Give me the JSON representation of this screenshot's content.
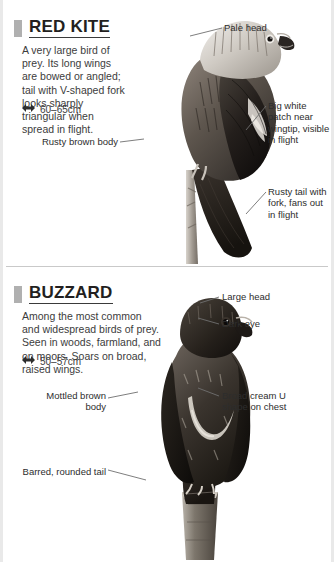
{
  "page": {
    "section_marker_color": "#b0b0b0",
    "text_color": "#2d2d2d",
    "leader_color": "#6f6f6f"
  },
  "entries": [
    {
      "id": "red-kite",
      "name": "RED KITE",
      "description": "A very large bird of prey. Its long wings are bowed or angled; tail with V-shaped fork looks sharply triangular when spread in flight.",
      "size_icon": "double-arrow-icon",
      "size": "60–65cm",
      "photo_alt": "Red kite perched, side view",
      "labels": [
        {
          "id": "pale-head",
          "text": "Pale head",
          "side": "right"
        },
        {
          "id": "white-patch",
          "text": "Big white patch near wingtip, visible in flight",
          "side": "right"
        },
        {
          "id": "rusty-tail",
          "text": "Rusty tail with fork, fans out in flight",
          "side": "right"
        },
        {
          "id": "rusty-body",
          "text": "Rusty brown body",
          "side": "left"
        }
      ]
    },
    {
      "id": "buzzard",
      "name": "BUZZARD",
      "description": "Among the most common and widespread birds of prey. Seen in woods, farmland, and on moors. Soars on broad, raised wings.",
      "size_icon": "double-arrow-icon",
      "size": "50–57cm",
      "photo_alt": "Buzzard perched on post, front view",
      "labels": [
        {
          "id": "large-head",
          "text": "Large head",
          "side": "right"
        },
        {
          "id": "dark-eye",
          "text": "Dark eye",
          "side": "right"
        },
        {
          "id": "cream-u",
          "text": "Broad cream U shape on chest",
          "side": "right"
        },
        {
          "id": "mottled-body",
          "text": "Mottled brown body",
          "side": "left"
        },
        {
          "id": "barred-tail",
          "text": "Barred, rounded tail",
          "side": "left"
        }
      ]
    }
  ]
}
